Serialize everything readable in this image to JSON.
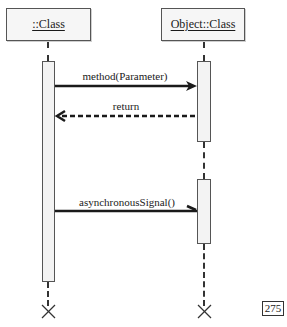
{
  "diagram": {
    "type": "UML sequence diagram",
    "lifelines": [
      {
        "label": "::Class",
        "x": 48
      },
      {
        "label": "Object::Class",
        "x": 204
      }
    ],
    "messages": [
      {
        "label": "method(Parameter)",
        "kind": "synchronous",
        "from": "::Class",
        "to": "Object::Class"
      },
      {
        "label": "return",
        "kind": "return",
        "from": "Object::Class",
        "to": "::Class"
      },
      {
        "label": "asynchronousSignal()",
        "kind": "asynchronous",
        "from": "::Class",
        "to": "Object::Class"
      }
    ],
    "terminators": [
      "destroy-x",
      "destroy-x"
    ]
  },
  "page": {
    "number": "275"
  },
  "colors": {
    "line": "#1a1a1a",
    "box_border": "#555555",
    "box_fill": "#f6f6f6"
  }
}
